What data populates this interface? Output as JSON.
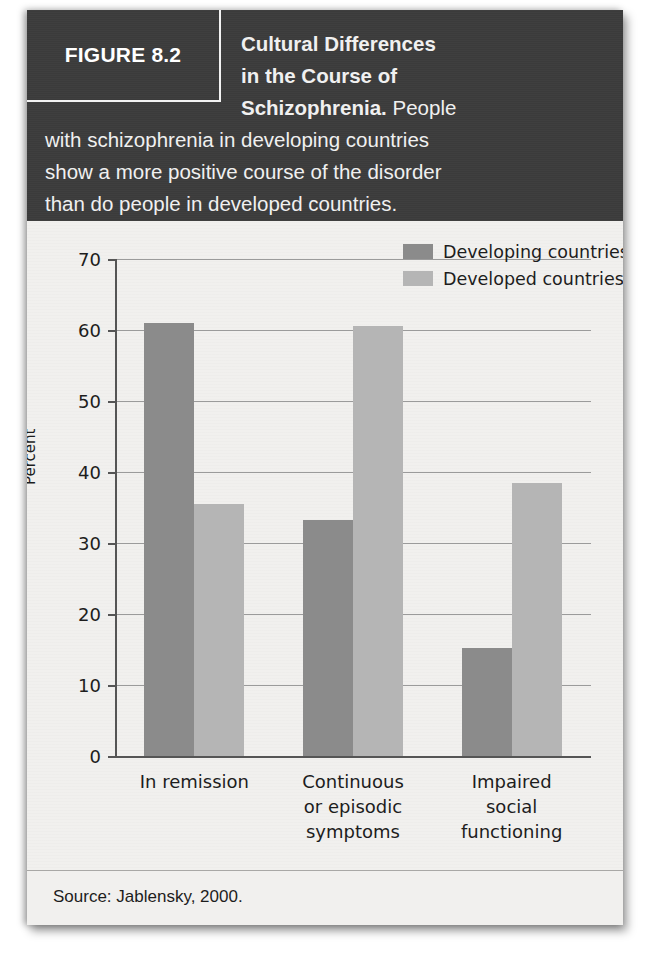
{
  "figure": {
    "badge_label": "FIGURE 8.2",
    "caption_bold": "Cultural Differences in the Course of Schizophrenia.",
    "caption_rest": "People with schizophrenia in developing countries show a more positive course of the disorder than do people in developed countries.",
    "caption_line1": "Cultural Differences",
    "caption_line2": "in the Course of",
    "caption_line3_bold": "Schizophrenia.",
    "caption_line3_rest": " People",
    "caption_line4": "with schizophrenia in developing countries",
    "caption_line5": "show a more positive course of the disorder",
    "caption_line6": "than do people in developed countries.",
    "source": "Source: Jablensky, 2000."
  },
  "chart_data": {
    "type": "bar",
    "title": "Cultural Differences in the Course of Schizophrenia",
    "xlabel": "",
    "ylabel": "Percent",
    "ylim": [
      0,
      70
    ],
    "yticks": [
      0,
      10,
      20,
      30,
      40,
      50,
      60,
      70
    ],
    "ytick_labels": [
      "0",
      "10",
      "20",
      "30",
      "40",
      "50",
      "60",
      "70"
    ],
    "grid": true,
    "legend_position": "top-right",
    "categories": [
      "In remission",
      "Continuous or episodic symptoms",
      "Impaired social functioning"
    ],
    "category_lines": [
      [
        "In remission"
      ],
      [
        "Continuous",
        "or episodic",
        "symptoms"
      ],
      [
        "Impaired",
        "social",
        "functioning"
      ]
    ],
    "series": [
      {
        "name": "Developing countries",
        "color": "#8b8b8b",
        "values": [
          61,
          33.3,
          15.2
        ]
      },
      {
        "name": "Developed countries",
        "color": "#b5b5b5",
        "values": [
          35.5,
          60.5,
          38.5
        ]
      }
    ]
  },
  "colors": {
    "header_bg": "#3c3c3c",
    "card_bg": "#f1f0ee",
    "developing": "#8b8b8b",
    "developed": "#b5b5b5",
    "gridline": "#9b9b9b",
    "axis": "#555555",
    "text": "#1d1d1d"
  }
}
